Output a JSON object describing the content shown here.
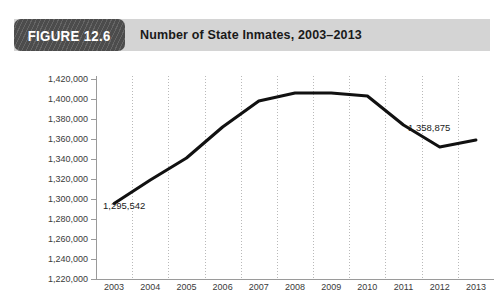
{
  "figure": {
    "badge_label": "FIGURE 12.6",
    "title": "Number of State Inmates, 2003–2013"
  },
  "colors": {
    "badge_background": "#4c4c4c",
    "header_band": "#d4d4d4",
    "line": "#111111",
    "gridline": "#b9b9b9",
    "axis": "#9a9a9a",
    "text": "#3a3a3a"
  },
  "chart_data": {
    "type": "line",
    "title": "Number of State Inmates, 2003–2013",
    "xlabel": "",
    "ylabel": "",
    "x": [
      2003,
      2004,
      2005,
      2006,
      2007,
      2008,
      2009,
      2010,
      2011,
      2012,
      2013
    ],
    "categories": [
      "2003",
      "2004",
      "2005",
      "2006",
      "2007",
      "2008",
      "2009",
      "2010",
      "2011",
      "2012",
      "2013"
    ],
    "values": [
      1295542,
      1319000,
      1341000,
      1372000,
      1398000,
      1406000,
      1406000,
      1403000,
      1374000,
      1352000,
      1358875
    ],
    "ylim": [
      1220000,
      1420000
    ],
    "ytick_step": 20000,
    "ytick_labels": [
      "1,420,000",
      "1,400,000",
      "1,380,000",
      "1,360,000",
      "1,340,000",
      "1,320,000",
      "1,300,000",
      "1,280,000",
      "1,260,000",
      "1,240,000",
      "1,220,000"
    ],
    "ytick_values": [
      1420000,
      1400000,
      1380000,
      1360000,
      1340000,
      1320000,
      1300000,
      1280000,
      1260000,
      1240000,
      1220000
    ],
    "grid": "vertical-dotted",
    "legend": null,
    "annotations": [
      {
        "name": "first-point-label",
        "text": "1,295,542",
        "x": 2003,
        "y": 1295542
      },
      {
        "name": "last-point-label",
        "text": "1,358,875",
        "x": 2013,
        "y": 1358875
      }
    ]
  }
}
